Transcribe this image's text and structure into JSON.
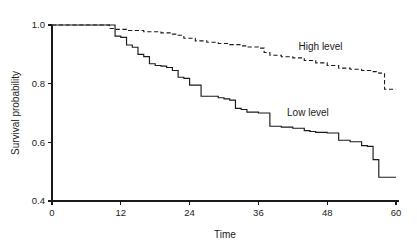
{
  "chart_data": {
    "type": "line",
    "subtype": "kaplan-meier-step",
    "title": "",
    "xlabel": "Time",
    "ylabel": "Survival probability",
    "xlim": [
      0,
      60
    ],
    "ylim": [
      0.4,
      1.0
    ],
    "xticks": [
      0,
      12,
      24,
      36,
      48,
      60
    ],
    "xtick_labels": [
      "0",
      "12",
      "24",
      "36",
      "48",
      "60"
    ],
    "yticks": [
      0.4,
      0.6,
      0.8,
      1.0
    ],
    "ytick_labels": [
      "0.4",
      "0.6",
      "0.8",
      "1.0"
    ],
    "grid": false,
    "legend_position": "inline-annotation",
    "series": [
      {
        "name": "High level",
        "style": "dashed",
        "color": "#1a1a1a",
        "label_x": 43.0,
        "label_y": 0.915,
        "x": [
          0,
          9,
          10,
          11,
          13,
          16,
          19,
          21,
          22,
          23,
          25,
          27,
          29,
          31,
          33,
          34,
          36,
          37,
          38,
          40,
          42,
          44,
          46,
          48,
          50,
          52,
          54,
          56,
          57,
          58,
          60
        ],
        "y": [
          1.0,
          1.0,
          0.988,
          0.985,
          0.981,
          0.977,
          0.973,
          0.969,
          0.965,
          0.955,
          0.946,
          0.941,
          0.937,
          0.933,
          0.929,
          0.925,
          0.921,
          0.906,
          0.897,
          0.892,
          0.888,
          0.879,
          0.871,
          0.862,
          0.853,
          0.849,
          0.845,
          0.841,
          0.836,
          0.781,
          0.781
        ]
      },
      {
        "name": "Low level",
        "style": "solid",
        "color": "#1a1a1a",
        "label_x": 41.0,
        "label_y": 0.69,
        "x": [
          0,
          9,
          11,
          12,
          13,
          14,
          15,
          16,
          17,
          18,
          19,
          20,
          21,
          22,
          23,
          24,
          26,
          28,
          29,
          30,
          31,
          32,
          33,
          34,
          36,
          38,
          40,
          42,
          44,
          45,
          46,
          48,
          50,
          52,
          54,
          55,
          56,
          57,
          60
        ],
        "y": [
          1.0,
          1.0,
          0.962,
          0.958,
          0.932,
          0.924,
          0.9,
          0.892,
          0.868,
          0.862,
          0.86,
          0.855,
          0.845,
          0.822,
          0.818,
          0.795,
          0.757,
          0.757,
          0.752,
          0.748,
          0.744,
          0.716,
          0.712,
          0.703,
          0.7,
          0.655,
          0.652,
          0.648,
          0.64,
          0.637,
          0.634,
          0.632,
          0.607,
          0.602,
          0.589,
          0.586,
          0.541,
          0.481,
          0.481
        ]
      }
    ]
  },
  "figure": {
    "background": "#ffffff",
    "ink_color": "#1a1a1a"
  }
}
